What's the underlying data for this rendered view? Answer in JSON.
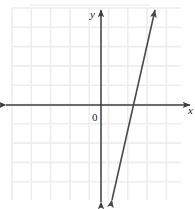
{
  "figure": {
    "kind": "cartesian-coordinate-plane-with-line",
    "width": 195,
    "height": 209,
    "background_color": "#ffffff"
  },
  "labels": {
    "y_axis": "y",
    "x_axis": "x",
    "origin": "0"
  },
  "colors": {
    "grid": "#ededed",
    "axis": "#3d3d3d",
    "line": "#4a4a4a",
    "top_rule": "#e2e2e2",
    "text": "#1a1a1a"
  },
  "grid": {
    "left": 12,
    "top": 8,
    "right": 181,
    "bottom": 200,
    "spacing": 19.3,
    "vertical_count": 9,
    "horizontal_count": 10,
    "visible": true
  },
  "axes": {
    "x_axis": {
      "y": 105,
      "x_start": 6,
      "x_end": 190,
      "arrow_left": true,
      "arrow_right": true
    },
    "y_axis": {
      "x": 101,
      "y_start": 10,
      "y_end": 202,
      "arrow_up": true,
      "arrow_down": true
    },
    "origin": {
      "x": 101,
      "y": 105
    }
  },
  "chart_data": {
    "type": "line",
    "title": "",
    "xlabel": "x",
    "ylabel": "y",
    "grid": true,
    "legend": null,
    "xlim": [
      -4.6,
      4.1
    ],
    "ylim": [
      -4.9,
      5.0
    ],
    "unit_px": 19.3,
    "series": [
      {
        "name": "line",
        "arrow_both_ends": true,
        "x_intercept": 1.5,
        "y_intercept": -6.6,
        "slope": 4.4,
        "equation": "y = 4.4x - 6.6",
        "endpoints_px": [
          {
            "x": 112,
            "y": 200
          },
          {
            "x": 155,
            "y": 10
          }
        ],
        "points": [
          {
            "x": 1.5,
            "y": 0
          },
          {
            "x": 2.8,
            "y": 5.0
          },
          {
            "x": 0.57,
            "y": -4.9
          }
        ]
      }
    ]
  },
  "top_rule": {
    "visible": true,
    "y": 5,
    "x_start": 30,
    "x_end": 150
  }
}
